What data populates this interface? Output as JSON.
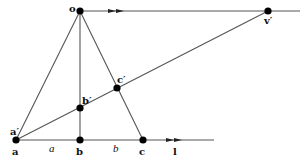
{
  "diagram": {
    "type": "geometry-perspective-construction",
    "points": [
      {
        "id": "o",
        "label": "o",
        "x": 80,
        "y": 11
      },
      {
        "id": "v_prime",
        "label": "v′",
        "x": 268,
        "y": 11
      },
      {
        "id": "a",
        "label": "a",
        "x": 16,
        "y": 140
      },
      {
        "id": "a_prime",
        "label": "a′",
        "x": 16,
        "y": 140
      },
      {
        "id": "b",
        "label": "b",
        "x": 80,
        "y": 140
      },
      {
        "id": "b_prime",
        "label": "b′",
        "x": 80,
        "y": 108
      },
      {
        "id": "c",
        "label": "c",
        "x": 143,
        "y": 140
      },
      {
        "id": "c_prime",
        "label": "c′",
        "x": 117,
        "y": 88
      }
    ],
    "segment_labels": {
      "ab": "a",
      "bc": "b"
    },
    "line_label": "l",
    "colors": {
      "line": "#555555",
      "point": "#000000",
      "text": "#111111"
    }
  }
}
